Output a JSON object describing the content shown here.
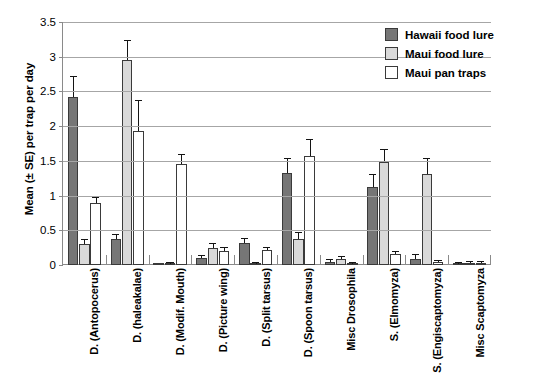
{
  "chart_data": {
    "type": "bar",
    "title": "",
    "xlabel": "",
    "ylabel": "Mean (± SE) per trap per day",
    "ylim": [
      0,
      3.5
    ],
    "yticks": [
      "0",
      "0.5",
      "1",
      "1.5",
      "2",
      "2.5",
      "3",
      "3.5"
    ],
    "ytick_values": [
      0,
      0.5,
      1,
      1.5,
      2,
      2.5,
      3,
      3.5
    ],
    "grid": "horizontal",
    "legend_position": "top-right-inside",
    "categories": [
      "D. (Antopocerus)",
      "D. (haleakalae)",
      "D. (Modif. Mouth)",
      "D. (Picture wing)",
      "D. (Split tarsus)",
      "D. (Spoon tarsus)",
      "Misc Drosophila",
      "S. (Elmomyza)",
      "S. (Engiscaptomyza)",
      "Misc Scaptomyza"
    ],
    "series": [
      {
        "name": "Hawaii food lure",
        "color": "#767676",
        "values": [
          2.42,
          0.38,
          0.0,
          0.1,
          0.32,
          1.32,
          0.05,
          1.13,
          0.09,
          0.02
        ],
        "errors": [
          0.29,
          0.05,
          0.0,
          0.03,
          0.05,
          0.2,
          0.02,
          0.16,
          0.05,
          0.01
        ]
      },
      {
        "name": "Maui food lure",
        "color": "#d9d9d9",
        "values": [
          0.3,
          2.95,
          0.02,
          0.25,
          0.01,
          0.38,
          0.08,
          1.49,
          1.31,
          0.03
        ],
        "errors": [
          0.06,
          0.28,
          0.01,
          0.05,
          0.01,
          0.08,
          0.03,
          0.17,
          0.21,
          0.01
        ]
      },
      {
        "name": "Maui pan traps",
        "color": "#ffffff",
        "values": [
          0.9,
          1.93,
          1.45,
          0.2,
          0.21,
          1.57,
          0.02,
          0.16,
          0.04,
          0.03
        ]
      }
    ],
    "series_errors_note": "Maui pan traps errors",
    "pan_trap_errors": [
      0.06,
      0.43,
      0.14,
      0.04,
      0.04,
      0.23,
      0.01,
      0.03,
      0.02,
      0.01
    ]
  },
  "legend": {
    "items": [
      {
        "label": "Hawaii food lure",
        "swatch": "s0"
      },
      {
        "label": "Maui food lure",
        "swatch": "s1"
      },
      {
        "label": "Maui pan traps",
        "swatch": "s2"
      }
    ]
  }
}
